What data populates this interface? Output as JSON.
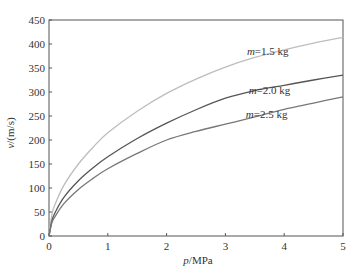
{
  "chart_data": {
    "type": "line",
    "title": "",
    "xlabel_var": "p",
    "xlabel_unit": "/MPa",
    "ylabel_var": "v",
    "ylabel_unit": "/(m/s)",
    "xlim": [
      0,
      5
    ],
    "ylim": [
      0,
      450
    ],
    "xticks": [
      0,
      1,
      2,
      3,
      4,
      5
    ],
    "yticks": [
      0,
      50,
      100,
      150,
      200,
      250,
      300,
      350,
      400,
      450
    ],
    "grid": false,
    "series": [
      {
        "name": "m=1.5 kg",
        "label_var": "m",
        "label_rest": "=1.5 kg",
        "color": "#bdbdbd",
        "x": [
          0,
          0.05,
          0.1,
          0.25,
          0.5,
          0.75,
          1,
          1.5,
          2,
          2.5,
          3,
          3.5,
          4,
          4.5,
          5
        ],
        "values": [
          0,
          45,
          65,
          105,
          150,
          185,
          215,
          260,
          297,
          327,
          352,
          372,
          388,
          402,
          414
        ]
      },
      {
        "name": "m=2.0 kg",
        "label_var": "m",
        "label_rest": "=2.0 kg",
        "color": "#555555",
        "x": [
          0,
          0.05,
          0.1,
          0.25,
          0.5,
          0.75,
          1,
          1.5,
          2,
          2.5,
          3,
          3.5,
          4,
          4.5,
          5
        ],
        "values": [
          0,
          32,
          48,
          80,
          115,
          142,
          165,
          203,
          235,
          263,
          287,
          303,
          314,
          325,
          335
        ]
      },
      {
        "name": "m=2.5 kg",
        "label_var": "m",
        "label_rest": "=2.5 kg",
        "color": "#777777",
        "x": [
          0,
          0.05,
          0.1,
          0.25,
          0.5,
          0.75,
          1,
          1.5,
          2,
          2.5,
          3,
          3.5,
          4,
          4.5,
          5
        ],
        "values": [
          0,
          28,
          40,
          67,
          97,
          120,
          140,
          172,
          200,
          218,
          233,
          248,
          264,
          277,
          290
        ]
      }
    ]
  }
}
